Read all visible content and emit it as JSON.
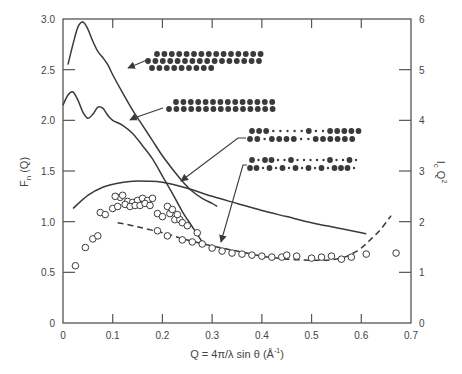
{
  "chart_data": {
    "type": "line",
    "title": "",
    "xlabel": "Q = 4π/λ sin θ (Å⁻¹)",
    "ylabel": "F_n (Q)",
    "y2label": "I_c Q²",
    "xlim": [
      0,
      0.7
    ],
    "ylim": [
      0,
      3.0
    ],
    "y2lim": [
      0,
      6
    ],
    "grid": false,
    "legend": "none (inset atom-chain schematics with arrows)",
    "x_ticks": [
      "0",
      "0.1",
      "0.2",
      "0.3",
      "0.4",
      "0.5",
      "0.6",
      "0.7"
    ],
    "y_ticks": [
      "0",
      "0.5",
      "1.0",
      "1.5",
      "2.0",
      "2.5",
      "3.0"
    ],
    "y2_ticks": [
      "0",
      "1",
      "2",
      "3",
      "4",
      "5",
      "6"
    ],
    "series": [
      {
        "name": "F_n(Q) – close-packed triple chain",
        "style": "solid",
        "x": [
          0.01,
          0.02,
          0.03,
          0.04,
          0.05,
          0.06,
          0.07,
          0.08,
          0.09,
          0.1,
          0.12,
          0.14,
          0.16,
          0.18,
          0.2,
          0.22,
          0.24,
          0.26,
          0.28,
          0.3,
          0.31
        ],
        "values": [
          2.55,
          2.75,
          2.92,
          2.97,
          2.9,
          2.78,
          2.68,
          2.62,
          2.55,
          2.45,
          2.27,
          2.1,
          1.95,
          1.8,
          1.65,
          1.52,
          1.4,
          1.3,
          1.23,
          1.18,
          1.15
        ]
      },
      {
        "name": "F_n(Q) – double chain",
        "style": "solid",
        "x": [
          0.0,
          0.01,
          0.02,
          0.03,
          0.04,
          0.05,
          0.06,
          0.07,
          0.08,
          0.09,
          0.1,
          0.12,
          0.14,
          0.16,
          0.18,
          0.2,
          0.22,
          0.24,
          0.26,
          0.28
        ],
        "values": [
          2.15,
          2.25,
          2.28,
          2.2,
          2.08,
          2.02,
          2.06,
          2.13,
          2.12,
          2.05,
          2.0,
          1.95,
          1.87,
          1.75,
          1.62,
          1.45,
          1.28,
          1.1,
          0.95,
          0.8
        ]
      },
      {
        "name": "F_n(Q) – defective double chain (solid)",
        "style": "solid",
        "x": [
          0.02,
          0.05,
          0.08,
          0.11,
          0.14,
          0.17,
          0.2,
          0.25,
          0.3,
          0.35,
          0.4,
          0.45,
          0.5,
          0.55,
          0.6,
          0.61
        ],
        "values": [
          1.13,
          1.26,
          1.34,
          1.38,
          1.4,
          1.4,
          1.39,
          1.33,
          1.25,
          1.18,
          1.11,
          1.05,
          0.99,
          0.94,
          0.89,
          0.88
        ]
      },
      {
        "name": "F_n(Q) – sparse double chain (dashed)",
        "style": "dashed",
        "x": [
          0.11,
          0.15,
          0.2,
          0.25,
          0.3,
          0.35,
          0.4,
          0.45,
          0.5,
          0.53,
          0.56,
          0.58,
          0.6,
          0.62,
          0.64,
          0.66
        ],
        "values": [
          0.99,
          0.95,
          0.89,
          0.82,
          0.76,
          0.71,
          0.66,
          0.63,
          0.62,
          0.62,
          0.64,
          0.68,
          0.74,
          0.83,
          0.93,
          1.06
        ]
      },
      {
        "name": "I_c Q² (experimental, open circles)",
        "style": "markers",
        "axis": "right",
        "x": [
          0.025,
          0.045,
          0.06,
          0.07,
          0.075,
          0.085,
          0.1,
          0.11,
          0.115,
          0.12,
          0.13,
          0.14,
          0.15,
          0.16,
          0.17,
          0.18,
          0.105,
          0.125,
          0.135,
          0.145,
          0.155,
          0.165,
          0.175,
          0.19,
          0.2,
          0.215,
          0.225,
          0.235,
          0.21,
          0.22,
          0.23,
          0.24,
          0.25,
          0.19,
          0.21,
          0.24,
          0.26,
          0.27,
          0.28,
          0.3,
          0.32,
          0.34,
          0.36,
          0.38,
          0.4,
          0.42,
          0.44,
          0.45,
          0.47,
          0.5,
          0.52,
          0.54,
          0.56,
          0.58,
          0.61,
          0.67
        ],
        "values": [
          1.13,
          1.49,
          1.66,
          1.72,
          2.18,
          2.14,
          2.26,
          2.3,
          2.48,
          2.52,
          2.4,
          2.38,
          2.42,
          2.46,
          2.42,
          2.46,
          2.5,
          2.34,
          2.3,
          2.32,
          2.32,
          2.36,
          2.32,
          2.16,
          2.1,
          2.16,
          2.04,
          2.04,
          2.3,
          2.24,
          2.14,
          1.98,
          1.92,
          1.82,
          1.72,
          1.64,
          1.6,
          1.78,
          1.56,
          1.48,
          1.42,
          1.38,
          1.36,
          1.34,
          1.32,
          1.3,
          1.3,
          1.34,
          1.32,
          1.28,
          1.3,
          1.32,
          1.26,
          1.3,
          1.36,
          1.38
        ]
      }
    ],
    "annotations": [
      {
        "label": "close-packed triple atom chain",
        "points_to": "series 1",
        "rows": [
          15,
          16,
          9
        ]
      },
      {
        "label": "double atom chain",
        "points_to": "series 2",
        "rows": [
          14,
          15
        ]
      },
      {
        "label": "double chain with small atoms",
        "points_to": "series 3",
        "pattern": [
          "LLLsssssLssLLLLL",
          "LLsLLLLssLLLLLL"
        ]
      },
      {
        "label": "sparse double chain with small atoms",
        "points_to": "series 4",
        "pattern": [
          "LsLLssLsssssLssLs",
          "LLsLsLsLsLsLsLLLs"
        ]
      }
    ]
  },
  "axes": {
    "x_label": "Q = 4π/λ sin θ (Å",
    "x_label_sup": "-1",
    "x_label_close": ")",
    "y_label_main": "F",
    "y_label_sub": "n",
    "y_label_tail": " (Q)",
    "y2_label_main": "I",
    "y2_label_sub": "c",
    "y2_label_tail": " Q",
    "y2_label_sup": "2"
  },
  "colors": {
    "line": "#3a3a3a",
    "axis": "#555555",
    "text": "#444444",
    "atom": "#3a3a3a",
    "background": "#ffffff"
  }
}
